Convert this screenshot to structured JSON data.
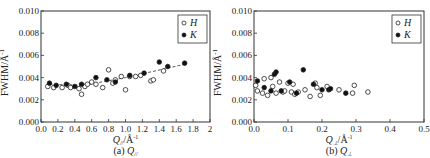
{
  "chart_data": [
    {
      "type": "scatter",
      "title": "(a) Q∥",
      "caption_prefix": "(a) ",
      "caption_symbol": "Q",
      "caption_sub": "//",
      "xlabel": "Q//Å⁻¹",
      "xlabel_symbol": "Q",
      "xlabel_sub": "//",
      "xlabel_unit": "/Å⁻¹",
      "ylabel": "FWHM/Å⁻¹",
      "xlim": [
        0.0,
        2.0
      ],
      "ylim": [
        0.0,
        0.01
      ],
      "xticks": [
        "0.0",
        "0.2",
        "0.4",
        "0.6",
        "0.8",
        "1.0",
        "1.2",
        "1.4",
        "1.6",
        "1.8",
        "2.0"
      ],
      "yticks": [
        "0.000",
        "0.002",
        "0.004",
        "0.006",
        "0.008",
        "0.010"
      ],
      "grid": false,
      "legend_position": "upper right",
      "trend_line": {
        "style": "dashed",
        "x": [
          0.1,
          0.5,
          1.0,
          1.7
        ],
        "y": [
          0.0034,
          0.0033,
          0.004,
          0.0052
        ]
      },
      "series": [
        {
          "name": "H",
          "marker": "open-circle",
          "x": [
            0.08,
            0.15,
            0.25,
            0.32,
            0.35,
            0.45,
            0.48,
            0.52,
            0.55,
            0.6,
            0.65,
            0.73,
            0.8,
            0.85,
            0.88,
            0.95,
            1.0,
            1.05,
            1.12,
            1.18,
            1.3,
            1.33,
            1.45
          ],
          "y": [
            0.0032,
            0.0031,
            0.0031,
            0.0033,
            0.0031,
            0.003,
            0.0025,
            0.0032,
            0.0034,
            0.0036,
            0.0034,
            0.0031,
            0.0047,
            0.0035,
            0.0038,
            0.0041,
            0.0029,
            0.0041,
            0.0041,
            0.0042,
            0.0037,
            0.0038,
            0.0046
          ]
        },
        {
          "name": "K",
          "marker": "filled-circle",
          "x": [
            0.1,
            0.18,
            0.3,
            0.4,
            0.48,
            0.65,
            0.78,
            0.88,
            1.05,
            1.22,
            1.4,
            1.5,
            1.7
          ],
          "y": [
            0.0035,
            0.0033,
            0.0034,
            0.0032,
            0.0034,
            0.004,
            0.0038,
            0.0036,
            0.0042,
            0.0044,
            0.0054,
            0.005,
            0.0053
          ]
        }
      ]
    },
    {
      "type": "scatter",
      "title": "(b) Q⊥",
      "caption_prefix": "(b) ",
      "caption_symbol": "Q",
      "caption_sub": "⊥",
      "xlabel": "Q⊥/Å⁻¹",
      "xlabel_symbol": "Q",
      "xlabel_sub": "⊥",
      "xlabel_unit": "/Å⁻¹",
      "ylabel": "FWHM/Å⁻¹",
      "xlim": [
        0.0,
        0.5
      ],
      "ylim": [
        0.0,
        0.01
      ],
      "xticks": [
        "0.0",
        "0.1",
        "0.2",
        "0.3",
        "0.4",
        "0.5"
      ],
      "yticks": [
        "0.000",
        "0.002",
        "0.004",
        "0.006",
        "0.008",
        "0.010"
      ],
      "grid": false,
      "legend_position": "upper right",
      "series": [
        {
          "name": "H",
          "marker": "open-circle",
          "x": [
            0.005,
            0.01,
            0.025,
            0.03,
            0.04,
            0.05,
            0.055,
            0.065,
            0.075,
            0.085,
            0.09,
            0.1,
            0.11,
            0.115,
            0.12,
            0.13,
            0.15,
            0.165,
            0.18,
            0.185,
            0.195,
            0.215,
            0.25,
            0.29,
            0.295,
            0.335
          ],
          "y": [
            0.0033,
            0.0028,
            0.0026,
            0.0039,
            0.0024,
            0.004,
            0.0032,
            0.0026,
            0.0036,
            0.0027,
            0.0028,
            0.0035,
            0.0027,
            0.0034,
            0.0025,
            0.0027,
            0.0029,
            0.0023,
            0.0035,
            0.0031,
            0.0024,
            0.0032,
            0.0029,
            0.0026,
            0.0033,
            0.0027
          ]
        },
        {
          "name": "K",
          "marker": "filled-circle",
          "x": [
            0.01,
            0.03,
            0.05,
            0.06,
            0.065,
            0.08,
            0.105,
            0.125,
            0.145,
            0.175,
            0.2,
            0.22,
            0.225,
            0.27
          ],
          "y": [
            0.0037,
            0.0031,
            0.0028,
            0.0043,
            0.0045,
            0.0028,
            0.0036,
            0.0026,
            0.0047,
            0.0034,
            0.0029,
            0.0029,
            0.003,
            0.0026
          ]
        }
      ]
    }
  ],
  "legend": {
    "h_label": "H",
    "k_label": "K"
  },
  "axis": {
    "ylabel_main": "FWHM/Å",
    "ylabel_exp": "-1"
  }
}
